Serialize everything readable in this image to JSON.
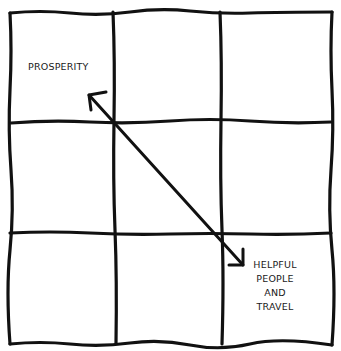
{
  "diagram": {
    "type": "3x3 grid with diagonal double-headed arrow",
    "grid": {
      "rows": 3,
      "cols": 3,
      "line_color": "#111111"
    },
    "labels": {
      "top_left": "PROSPERITY",
      "bottom_right": {
        "line1": "HELPFUL",
        "line2": "PEOPLE",
        "line3": "AND",
        "line4": "TRAVEL"
      }
    },
    "arrow": {
      "from": "bottom-right cell",
      "to": "top-left cell",
      "double_headed": true
    }
  }
}
